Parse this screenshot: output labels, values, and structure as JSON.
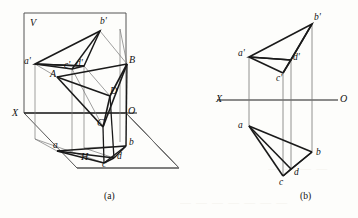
{
  "figure": {
    "captions": {
      "left": "(a)",
      "right": "(b)"
    },
    "stroke_color": "#1a1a1a",
    "thin_color": "#555555"
  },
  "panel_a": {
    "name": "pictorial-view",
    "plane_labels": {
      "v_plane": "V",
      "h_plane": "H",
      "axis_x": "X",
      "axis_o": "O"
    },
    "space_points": [
      {
        "label": "A",
        "x": 56,
        "y": 74
      },
      {
        "label": "B",
        "x": 126,
        "y": 60
      },
      {
        "label": "C",
        "x": 104,
        "y": 123
      },
      {
        "label": "D",
        "x": 109,
        "y": 92
      }
    ],
    "front_projections": [
      {
        "label": "a'",
        "x": 27,
        "y": 62
      },
      {
        "label": "b'",
        "x": 101,
        "y": 22
      },
      {
        "label": "c'",
        "x": 68,
        "y": 66
      },
      {
        "label": "d'",
        "x": 79,
        "y": 64
      }
    ],
    "top_projections": [
      {
        "label": "a",
        "x": 58,
        "y": 145
      },
      {
        "label": "b",
        "x": 128,
        "y": 141
      },
      {
        "label": "c",
        "x": 105,
        "y": 160
      },
      {
        "label": "d",
        "x": 119,
        "y": 154
      }
    ]
  },
  "panel_b": {
    "name": "orthographic-view",
    "axis": {
      "label_left": "X",
      "label_right": "O",
      "y": 100
    },
    "front_view_points": [
      {
        "label": "a'",
        "x": 242,
        "y": 57
      },
      {
        "label": "b'",
        "x": 317,
        "y": 18
      },
      {
        "label": "c'",
        "x": 277,
        "y": 73
      },
      {
        "label": "d'",
        "x": 301,
        "y": 58
      }
    ],
    "top_view_points": [
      {
        "label": "a",
        "x": 242,
        "y": 126
      },
      {
        "label": "b",
        "x": 317,
        "y": 152
      },
      {
        "label": "c",
        "x": 281,
        "y": 176
      },
      {
        "label": "d",
        "x": 301,
        "y": 169
      }
    ]
  }
}
